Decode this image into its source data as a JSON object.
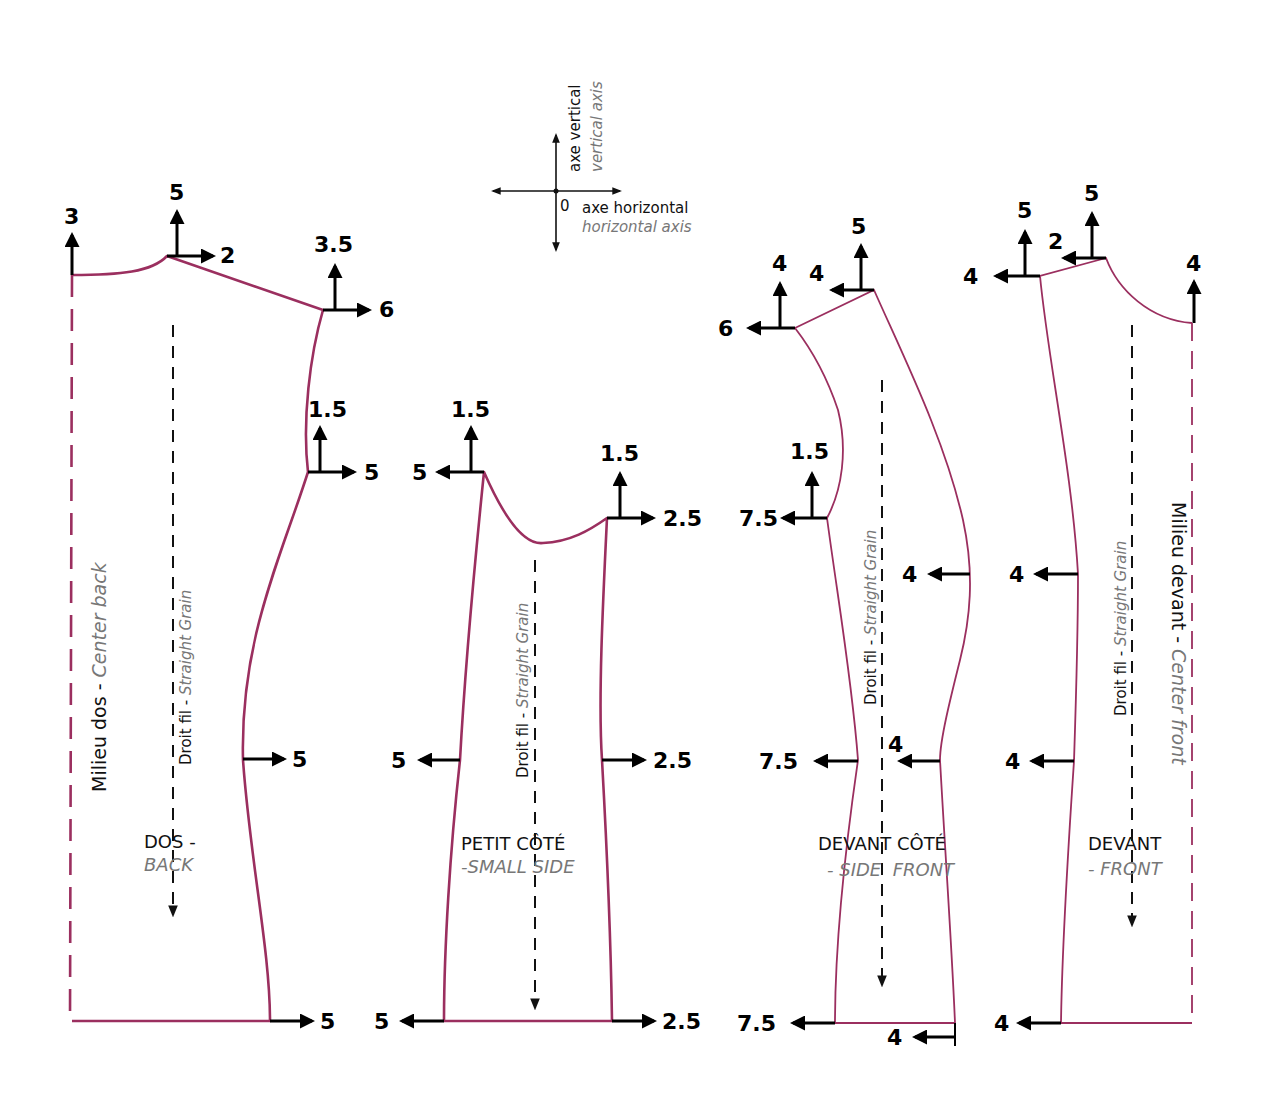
{
  "colors": {
    "outline": "#9b2f5f",
    "arrow": "#000000",
    "text_primary": "#111111",
    "text_secondary": "#777777",
    "background": "#ffffff"
  },
  "legend": {
    "vertical_fr": "axe vertical",
    "vertical_en": "vertical axis",
    "horizontal_fr": "axe horizontal",
    "horizontal_en": "horizontal axis",
    "origin": "0"
  },
  "grain": {
    "fr": "Droit fil",
    "sep": " - ",
    "en": "Straight Grain"
  },
  "pieces": {
    "back": {
      "name_fr": "DOS -",
      "name_en": "BACK",
      "center_fr": "Milieu dos",
      "center_sep": " - ",
      "center_en": "Center back",
      "grades": {
        "cb_top_up": "3",
        "neck_up": "5",
        "neck_right": "2",
        "shoulder_up": "3.5",
        "shoulder_right": "6",
        "armhole_up": "1.5",
        "armhole_right": "5",
        "waist_right": "5",
        "hem_right": "5"
      }
    },
    "small_side": {
      "name_fr": "PETIT CÔTÉ",
      "name_en": "-SMALL SIDE",
      "grades": {
        "left_top_up": "1.5",
        "left_top_left": "5",
        "right_top_up": "1.5",
        "right_top_right": "2.5",
        "waist_left": "5",
        "waist_right": "2.5",
        "hem_left": "5",
        "hem_right": "2.5"
      }
    },
    "side_front": {
      "name_fr": "DEVANT CÔTÉ",
      "name_en": "- SIDE  FRONT",
      "grades": {
        "shoulder_up": "4",
        "shoulder_left": "6",
        "neck_left": "4",
        "neck_up": "5",
        "armhole_up": "1.5",
        "armhole_left": "7.5",
        "bust_left": "4",
        "waist_left": "7.5",
        "waist_right_left": "4",
        "hem_left": "7.5",
        "hem_right_left": "4"
      }
    },
    "front": {
      "name_fr": "DEVANT",
      "name_en": "- FRONT",
      "center_fr": "Milieu devant",
      "center_sep": " - ",
      "center_en": "Center front",
      "grades": {
        "shoulder_left": "4",
        "shoulder_up": "5",
        "neck_left": "2",
        "neck_up": "5",
        "cf_up": "4",
        "bust_left": "4",
        "waist_left": "4",
        "hem_left": "4"
      }
    }
  }
}
